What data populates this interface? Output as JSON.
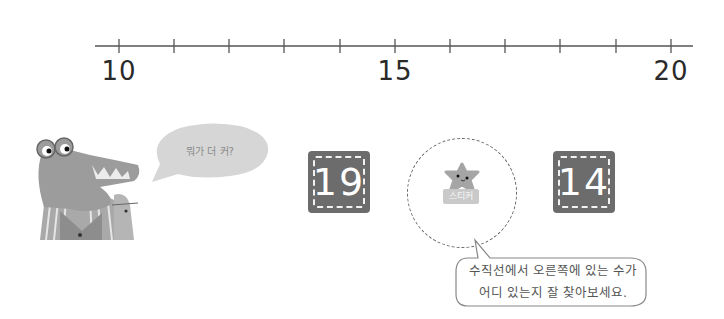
{
  "number_line": {
    "min": 10,
    "max": 20,
    "step": 1,
    "labels": [
      {
        "value": "10",
        "x": 119
      },
      {
        "value": "15",
        "x": 395
      },
      {
        "value": "20",
        "x": 671
      }
    ],
    "tick_positions": [
      119,
      174,
      229,
      284,
      340,
      395,
      450,
      505,
      560,
      616,
      671
    ],
    "axis_color": "#555555"
  },
  "character": {
    "name": "crocodile",
    "speech_bubble": "뭐가 더 커?"
  },
  "cards": [
    {
      "value": "19",
      "color": "#6c6c6c"
    },
    {
      "value": "14",
      "color": "#6c6c6c"
    }
  ],
  "sticker_slot": {
    "label": "스티커"
  },
  "hint": {
    "line1": "수직선에서 오른쪽에 있는 수가",
    "line2": "어디 있는지 잘 찾아보세요."
  },
  "chart_data": {
    "type": "number_line",
    "range": [
      10,
      20
    ],
    "major_ticks": [
      10,
      15,
      20
    ],
    "minor_ticks": [
      11,
      12,
      13,
      14,
      16,
      17,
      18,
      19
    ],
    "compare_values": [
      19,
      14
    ]
  }
}
